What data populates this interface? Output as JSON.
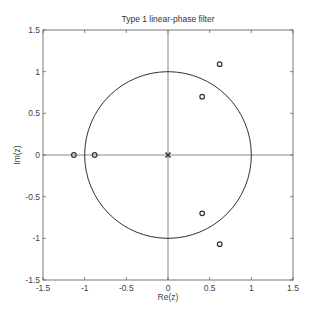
{
  "chart_data": {
    "type": "scatter",
    "subtype": "pole-zero plot",
    "title": "Type 1 linear-phase filter",
    "xlabel": "Re(z)",
    "ylabel": "Im(z)",
    "xlim": [
      -1.5,
      1.5
    ],
    "ylim": [
      -1.5,
      1.5
    ],
    "xticks": [
      -1.5,
      -1,
      -0.5,
      0,
      0.5,
      1,
      1.5
    ],
    "yticks": [
      -1.5,
      -1,
      -0.5,
      0,
      0.5,
      1,
      1.5
    ],
    "xtick_labels": [
      "-1.5",
      "-1",
      "-0.5",
      "0",
      "0.5",
      "1",
      "1.5"
    ],
    "ytick_labels": [
      "-1.5",
      "-1",
      "-0.5",
      "0",
      "0.5",
      "1",
      "1.5"
    ],
    "grid": false,
    "unit_circle": true,
    "series": [
      {
        "name": "zeros",
        "marker": "o",
        "points": [
          {
            "re": -1.13,
            "im": 0
          },
          {
            "re": -0.88,
            "im": 0
          },
          {
            "re": 0.41,
            "im": 0.7
          },
          {
            "re": 0.41,
            "im": -0.7
          },
          {
            "re": 0.62,
            "im": 1.09
          },
          {
            "re": 0.62,
            "im": -1.07
          }
        ]
      },
      {
        "name": "poles",
        "marker": "x",
        "points": [
          {
            "re": 0,
            "im": 0
          }
        ]
      }
    ]
  },
  "colors": {
    "line": "#333333",
    "axes": "#555555"
  }
}
